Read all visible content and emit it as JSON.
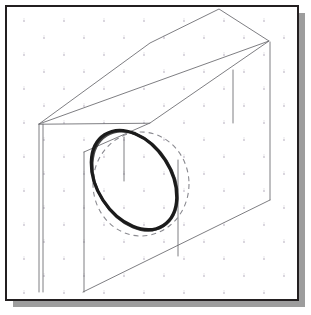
{
  "app": {
    "title": "Isometric Sketch Canvas",
    "kind": "cad-sketch-viewport"
  },
  "frame": {
    "border_color": "#231f20",
    "border_width": 2,
    "paper_color": "#ffffff",
    "shadow_color": "#9d9d9d",
    "shadow_offset_x": 7,
    "shadow_offset_y": 7,
    "x": 6,
    "y": 6,
    "width": 292,
    "height": 294
  },
  "grid": {
    "name": "isometric-dot-grid",
    "dot_color": "#c9c4cf",
    "dot_radius": 0.9,
    "spacing_x": 40,
    "spacing_y": 34,
    "row_offset_x": 20,
    "tick_color": "#bdb8c4",
    "visible": true
  },
  "drawing": {
    "name": "isometric-block-with-circular-hole",
    "line_color": "#6f6f74",
    "line_width": 0.9,
    "block": {
      "label": "rectangular-block",
      "top_face": [
        [
          39,
          124
        ],
        [
          150,
          43
        ],
        [
          219,
          9
        ],
        [
          268,
          41
        ],
        [
          268,
          41
        ],
        [
          150,
          123
        ]
      ],
      "front_face_top": [
        [
          39,
          124
        ],
        [
          268,
          41
        ]
      ],
      "front_left_edge": [
        [
          39,
          124
        ],
        [
          39,
          292
        ]
      ],
      "right_edge": [
        [
          270,
          41
        ],
        [
          270,
          200
        ]
      ],
      "bottom_edge": [
        [
          83,
          292
        ],
        [
          270,
          200
        ]
      ],
      "top_ridge": [
        [
          219,
          9
        ],
        [
          268,
          41
        ]
      ],
      "top_back_edge": [
        [
          150,
          43
        ],
        [
          219,
          9
        ]
      ],
      "top_left_edge": [
        [
          39,
          124
        ],
        [
          150,
          43
        ]
      ],
      "notch_corner": [
        [
          84,
          152
        ],
        [
          150,
          123
        ]
      ]
    },
    "detail_lines": [
      {
        "name": "vertical-construction-line-right",
        "x1": 233,
        "y1": 70,
        "x2": 233,
        "y2": 123
      },
      {
        "name": "vertical-construction-line-hole-center",
        "x1": 124,
        "y1": 137,
        "x2": 124,
        "y2": 180
      },
      {
        "name": "vertical-edge-left-inner",
        "x1": 42,
        "y1": 124,
        "x2": 42,
        "y2": 292
      },
      {
        "name": "vertical-edge-left-outer",
        "x1": 84,
        "y1": 152,
        "x2": 84,
        "y2": 292
      },
      {
        "name": "vertical-edge-mid",
        "x1": 178,
        "y1": 160,
        "x2": 178,
        "y2": 256
      }
    ],
    "dashed_circle": {
      "label": "reference-circle-dashed",
      "center_x": 141,
      "center_y": 184,
      "radius_x": 48,
      "radius_y": 52,
      "color": "#8a8a90",
      "dash": "5 4",
      "width": 1.1
    },
    "bold_ellipse": {
      "label": "hand-drawn-hole-ellipse",
      "center_x": 134,
      "center_y": 180,
      "radius_x": 37,
      "radius_y": 54,
      "rotation_deg": -33,
      "color": "#1c1c1c",
      "width": 3.2
    }
  },
  "annotations": {
    "caption": "",
    "labels": []
  }
}
